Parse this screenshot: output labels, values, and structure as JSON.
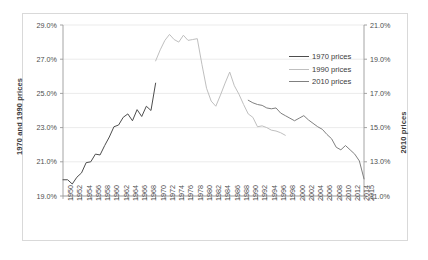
{
  "chart_data": {
    "type": "line",
    "title": "",
    "subtitle": "",
    "xlabel": "",
    "ylabel": "1970 and 1990 prices",
    "ylabel_right": "2010 prices",
    "grid": true,
    "legend_position": "right-top",
    "x_tick_labels": [
      "1950",
      "1952",
      "1954",
      "1956",
      "1958",
      "1960",
      "1962",
      "1964",
      "1966",
      "1968",
      "1970",
      "1972",
      "1974",
      "1976",
      "1978",
      "1980",
      "1982",
      "1984",
      "1986",
      "1988",
      "1990",
      "1992",
      "1994",
      "1996",
      "1998",
      "2000",
      "2002",
      "2004",
      "2006",
      "2008",
      "2010",
      "2012",
      "2014",
      "2015"
    ],
    "x_range": [
      1950,
      2015
    ],
    "y_left_ticks": [
      "19.0%",
      "21.0%",
      "23.0%",
      "25.0%",
      "27.0%",
      "29.0%"
    ],
    "y_left_lim": [
      19.0,
      29.0
    ],
    "y_right_ticks": [
      "11.0%",
      "13.0%",
      "15.0%",
      "17.0%",
      "19.0%",
      "21.0%"
    ],
    "y_right_lim": [
      11.0,
      21.0
    ],
    "series": [
      {
        "name": "1970 prices",
        "axis": "left",
        "color": "#4d4d4d",
        "x": [
          1950,
          1951,
          1952,
          1953,
          1954,
          1955,
          1956,
          1957,
          1958,
          1959,
          1960,
          1961,
          1962,
          1963,
          1964,
          1965,
          1966,
          1967,
          1968,
          1969,
          1970
        ],
        "values": [
          19.95,
          19.95,
          19.7,
          20.1,
          20.35,
          20.95,
          21.0,
          21.45,
          21.4,
          21.95,
          22.45,
          23.05,
          23.15,
          23.6,
          23.8,
          23.4,
          24.05,
          23.65,
          24.25,
          24.0,
          25.6
        ]
      },
      {
        "name": "1990 prices",
        "axis": "left",
        "color": "#bfbfbf",
        "x": [
          1970,
          1971,
          1972,
          1973,
          1974,
          1975,
          1976,
          1977,
          1978,
          1979,
          1980,
          1981,
          1982,
          1983,
          1984,
          1985,
          1986,
          1987,
          1988,
          1989,
          1990,
          1991,
          1992,
          1993,
          1994,
          1995,
          1996,
          1997,
          1998
        ],
        "values": [
          26.9,
          27.55,
          28.1,
          28.45,
          28.15,
          28.0,
          28.4,
          28.1,
          28.15,
          28.2,
          26.7,
          25.3,
          24.55,
          24.25,
          24.9,
          25.6,
          26.25,
          25.45,
          24.95,
          24.35,
          23.8,
          23.6,
          23.05,
          23.1,
          23.0,
          22.85,
          22.8,
          22.7,
          22.55
        ]
      },
      {
        "name": "2010 prices",
        "axis": "right",
        "color": "#808080",
        "x": [
          1990,
          1991,
          1992,
          1993,
          1994,
          1995,
          1996,
          1997,
          1998,
          1999,
          2000,
          2001,
          2002,
          2003,
          2004,
          2005,
          2006,
          2007,
          2008,
          2009,
          2010,
          2011,
          2012,
          2013,
          2014,
          2015
        ],
        "values": [
          16.6,
          16.45,
          16.35,
          16.3,
          16.15,
          16.1,
          16.15,
          15.85,
          15.7,
          15.55,
          15.4,
          15.55,
          15.7,
          15.45,
          15.25,
          15.05,
          14.9,
          14.6,
          14.35,
          13.85,
          13.7,
          13.95,
          13.7,
          13.45,
          13.05,
          12.0
        ]
      }
    ]
  },
  "legend": {
    "items": [
      {
        "label": "1970 prices",
        "color": "#4d4d4d"
      },
      {
        "label": "1990 prices",
        "color": "#bfbfbf"
      },
      {
        "label": "2010 prices",
        "color": "#808080"
      }
    ]
  }
}
